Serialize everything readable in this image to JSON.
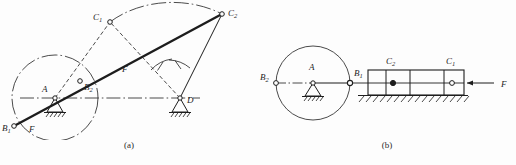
{
  "figure": {
    "type": "engineering-mechanism-diagram",
    "ink_color": "#1d1d1d",
    "background_color": "#fdfdfd"
  },
  "panel_a": {
    "caption": "(a)",
    "points": [
      {
        "name": "A",
        "label": "A",
        "sub": "",
        "marker": "pivot-ground"
      },
      {
        "name": "B1",
        "label": "B",
        "sub": "1",
        "marker": "hollow-circle"
      },
      {
        "name": "B2",
        "label": "B",
        "sub": "2",
        "marker": "hollow-circle"
      },
      {
        "name": "C1",
        "label": "C",
        "sub": "1",
        "marker": "hollow-circle"
      },
      {
        "name": "C2",
        "label": "C",
        "sub": "2",
        "marker": "hollow-circle"
      },
      {
        "name": "D",
        "label": "D",
        "sub": "",
        "marker": "pivot-ground"
      }
    ],
    "force_labels": [
      {
        "name": "force-lower-left",
        "label": "F"
      },
      {
        "name": "force-on-coupler",
        "label": "F"
      }
    ]
  },
  "panel_b": {
    "caption": "(b)",
    "points": [
      {
        "name": "A",
        "label": "A",
        "sub": "",
        "marker": "pivot-ground"
      },
      {
        "name": "B1",
        "label": "B",
        "sub": "1",
        "marker": "hollow-circle"
      },
      {
        "name": "B2",
        "label": "B",
        "sub": "2",
        "marker": "hollow-circle"
      },
      {
        "name": "C1",
        "label": "C",
        "sub": "1",
        "marker": "hollow-circle"
      },
      {
        "name": "C2",
        "label": "C",
        "sub": "2",
        "marker": "filled-dot"
      }
    ],
    "force_labels": [
      {
        "name": "force-on-slider",
        "label": "F"
      }
    ]
  }
}
